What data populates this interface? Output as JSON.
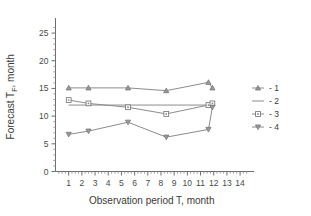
{
  "chart_data": {
    "type": "line",
    "title": "",
    "xlabel": "Observation period T, month",
    "ylabel": "Forecast T",
    "ylabel_sub": "F",
    "ylabel_tail": ", month",
    "xlim": [
      0,
      14.6
    ],
    "ylim": [
      0,
      27
    ],
    "grid": false,
    "legend_position": "right",
    "xticks": [
      1,
      2,
      3,
      4,
      5,
      6,
      7,
      8,
      9,
      10,
      11,
      12,
      13,
      14
    ],
    "xticklabels": [
      "1",
      "2",
      "3",
      "4",
      "5",
      "6",
      "7",
      "8",
      "9",
      "10",
      "11",
      "12",
      "13",
      "14"
    ],
    "yticks": [
      0,
      5,
      10,
      15,
      20,
      25
    ],
    "yticklabels": [
      "0",
      "5",
      "10",
      "15",
      "20",
      "25"
    ],
    "series": [
      {
        "name": "- 1",
        "marker": "triangle-up",
        "x": [
          1.0,
          2.5,
          5.5,
          8.4,
          11.6,
          11.9
        ],
        "values": [
          15.1,
          15.1,
          15.1,
          14.6,
          16.1,
          15.1
        ]
      },
      {
        "name": "- 2",
        "marker": "line",
        "x": [
          1.0,
          11.9
        ],
        "values": [
          12.0,
          12.0
        ]
      },
      {
        "name": "- 3",
        "marker": "square",
        "x": [
          1.0,
          2.5,
          5.5,
          8.4,
          11.6,
          11.9
        ],
        "values": [
          12.9,
          12.3,
          11.6,
          10.4,
          12.0,
          12.3
        ]
      },
      {
        "name": "- 4",
        "marker": "triangle-down",
        "x": [
          1.0,
          2.5,
          5.5,
          8.4,
          11.6,
          11.9
        ],
        "values": [
          6.7,
          7.3,
          8.9,
          6.2,
          7.6,
          11.6
        ]
      }
    ],
    "colors": {
      "line": "#8c8c8c",
      "marker_fill": "#9a9a9a",
      "axis": "#6e6e6e",
      "text": "#3a3a3a"
    }
  },
  "legend": {
    "items": [
      {
        "label": "- 1",
        "marker": "triangle-up"
      },
      {
        "label": "- 2",
        "marker": "line"
      },
      {
        "label": "- 3",
        "marker": "square"
      },
      {
        "label": "- 4",
        "marker": "triangle-down"
      }
    ]
  }
}
